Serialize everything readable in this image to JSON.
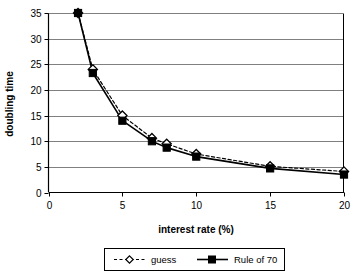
{
  "chart_data": {
    "type": "line",
    "title": "",
    "xlabel": "interest rate (%)",
    "ylabel": "doubling time",
    "xlim": [
      0,
      20
    ],
    "ylim": [
      0,
      35
    ],
    "xticks": [
      "0",
      "5",
      "10",
      "15",
      "20"
    ],
    "xtick_values": [
      0,
      5,
      10,
      15,
      20
    ],
    "yticks": [
      "0",
      "5",
      "10",
      "15",
      "20",
      "25",
      "30",
      "35"
    ],
    "ytick_values": [
      0,
      5,
      10,
      15,
      20,
      25,
      30,
      35
    ],
    "grid": "horizontal",
    "legend_position": "bottom",
    "x": [
      2,
      3,
      5,
      7,
      8,
      10,
      15,
      20
    ],
    "series": [
      {
        "name": "guess",
        "values": [
          35,
          24,
          15,
          10.6,
          9.5,
          7.5,
          5.1,
          4.1
        ],
        "line_style": "dashed",
        "marker": "diamond-open",
        "color": "#000000"
      },
      {
        "name": "Rule of 70",
        "values": [
          35,
          23.3,
          14,
          10,
          8.75,
          7,
          4.7,
          3.5
        ],
        "line_style": "solid",
        "marker": "square-filled",
        "color": "#000000"
      }
    ]
  },
  "legend": {
    "items": [
      {
        "label": "guess"
      },
      {
        "label": "Rule of 70"
      }
    ]
  },
  "colors": {
    "background": "#ffffff",
    "axis": "#000000",
    "grid": "#808080",
    "series": "#000000"
  }
}
